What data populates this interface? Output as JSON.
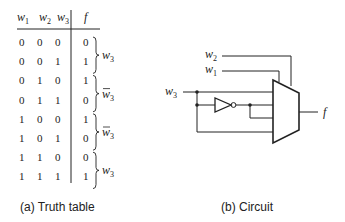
{
  "truth_table": {
    "headers": [
      "w1",
      "w2",
      "w3",
      "f"
    ],
    "rows": [
      {
        "w1": "0",
        "w2": "0",
        "w3": "0",
        "f": "0"
      },
      {
        "w1": "0",
        "w2": "0",
        "w3": "1",
        "f": "1"
      },
      {
        "w1": "0",
        "w2": "1",
        "w3": "0",
        "f": "1"
      },
      {
        "w1": "0",
        "w2": "1",
        "w3": "1",
        "f": "0"
      },
      {
        "w1": "1",
        "w2": "0",
        "w3": "0",
        "f": "1"
      },
      {
        "w1": "1",
        "w2": "0",
        "w3": "1",
        "f": "0"
      },
      {
        "w1": "1",
        "w2": "1",
        "w3": "0",
        "f": "0"
      },
      {
        "w1": "1",
        "w2": "1",
        "w3": "1",
        "f": "1"
      }
    ],
    "groups": [
      {
        "label": "w3",
        "negated": false
      },
      {
        "label": "w3",
        "negated": true
      },
      {
        "label": "w3",
        "negated": true
      },
      {
        "label": "w3",
        "negated": false
      }
    ],
    "caption": "(a) Truth table"
  },
  "circuit": {
    "inputs": {
      "w2": "w2",
      "w1": "w1",
      "w3": "w3"
    },
    "output": "f",
    "components": [
      "4-to-1 multiplexer",
      "inverter"
    ],
    "caption": "(b) Circuit"
  }
}
